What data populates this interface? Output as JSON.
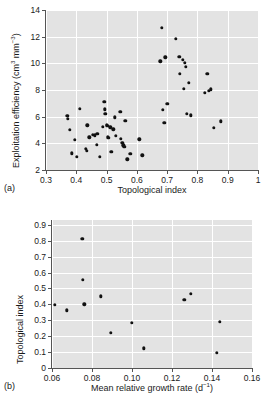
{
  "figure": {
    "background_color": "#ffffff",
    "plot_background_color": "#e3e3e3",
    "gridline_color": "#ffffff",
    "marker_color": "#111111",
    "axis_color": "#555555"
  },
  "panel_a": {
    "label": "(a)",
    "xlabel": "Topological index",
    "ylabel_html": "Exploitation efficiency (cm<sup>3</sup> mm<sup>−3</sup>)",
    "ylabel_plain": "Exploitation efficiency (cm3 mm-3)",
    "xticks": [
      "0.3",
      "0.4",
      "0.5",
      "0.6",
      "0.7",
      "0.8",
      "0.9",
      "1"
    ],
    "yticks": [
      "2",
      "4",
      "6",
      "8",
      "10",
      "12",
      "14"
    ]
  },
  "panel_b": {
    "label": "(b)",
    "xlabel_html": "Mean relative growth rate (d<sup>−1</sup>)",
    "xlabel_plain": "Mean relative growth rate (d-1)",
    "ylabel": "Topological index",
    "xticks": [
      "0.06",
      "0.08",
      "0.10",
      "0.12",
      "0.14",
      "0.16"
    ],
    "yticks": [
      "0",
      "0.1",
      "0.2",
      "0.3",
      "0.4",
      "0.5",
      "0.6",
      "0.7",
      "0.8",
      "0.9"
    ]
  },
  "chart_data": [
    {
      "type": "scatter",
      "panel": "a",
      "title": "",
      "xlabel": "Topological index",
      "ylabel": "Exploitation efficiency (cm3 mm-3)",
      "xlim": [
        0.3,
        1.0
      ],
      "ylim": [
        2,
        14
      ],
      "xticks": [
        0.3,
        0.4,
        0.5,
        0.6,
        0.7,
        0.8,
        0.9,
        1.0
      ],
      "yticks": [
        2,
        4,
        6,
        8,
        10,
        12,
        14
      ],
      "grid": true,
      "legend": "none",
      "points": [
        [
          0.37,
          6.05
        ],
        [
          0.372,
          5.85
        ],
        [
          0.378,
          5.0
        ],
        [
          0.385,
          3.25
        ],
        [
          0.395,
          4.25
        ],
        [
          0.402,
          3.0
        ],
        [
          0.412,
          6.6
        ],
        [
          0.432,
          3.6
        ],
        [
          0.435,
          3.45
        ],
        [
          0.437,
          5.35
        ],
        [
          0.443,
          4.45
        ],
        [
          0.455,
          4.65
        ],
        [
          0.462,
          4.6
        ],
        [
          0.468,
          3.9
        ],
        [
          0.47,
          4.7
        ],
        [
          0.478,
          3.0
        ],
        [
          0.487,
          5.25
        ],
        [
          0.492,
          7.1
        ],
        [
          0.494,
          6.55
        ],
        [
          0.496,
          6.2
        ],
        [
          0.5,
          5.4
        ],
        [
          0.502,
          5.3
        ],
        [
          0.505,
          4.45
        ],
        [
          0.508,
          4.4
        ],
        [
          0.512,
          5.2
        ],
        [
          0.515,
          3.35
        ],
        [
          0.522,
          5.05
        ],
        [
          0.528,
          5.95
        ],
        [
          0.53,
          4.55
        ],
        [
          0.545,
          6.35
        ],
        [
          0.548,
          4.35
        ],
        [
          0.552,
          4.05
        ],
        [
          0.555,
          3.85
        ],
        [
          0.558,
          3.75
        ],
        [
          0.562,
          5.7
        ],
        [
          0.568,
          2.8
        ],
        [
          0.578,
          3.2
        ],
        [
          0.608,
          4.3
        ],
        [
          0.618,
          3.1
        ],
        [
          0.678,
          10.15
        ],
        [
          0.682,
          12.65
        ],
        [
          0.685,
          6.5
        ],
        [
          0.69,
          5.55
        ],
        [
          0.694,
          10.45
        ],
        [
          0.7,
          6.95
        ],
        [
          0.728,
          11.85
        ],
        [
          0.74,
          10.5
        ],
        [
          0.742,
          9.2
        ],
        [
          0.752,
          10.25
        ],
        [
          0.756,
          8.1
        ],
        [
          0.758,
          10.05
        ],
        [
          0.762,
          9.75
        ],
        [
          0.765,
          6.2
        ],
        [
          0.772,
          8.55
        ],
        [
          0.778,
          6.1
        ],
        [
          0.825,
          7.8
        ],
        [
          0.832,
          9.2
        ],
        [
          0.838,
          7.95
        ],
        [
          0.845,
          8.05
        ],
        [
          0.855,
          5.15
        ],
        [
          0.878,
          5.65
        ]
      ]
    },
    {
      "type": "scatter",
      "panel": "b",
      "title": "",
      "xlabel": "Mean relative growth rate (d-1)",
      "ylabel": "Topological index",
      "xlim": [
        0.06,
        0.16
      ],
      "ylim": [
        0.0,
        0.93
      ],
      "xticks": [
        0.06,
        0.08,
        0.1,
        0.12,
        0.14,
        0.16
      ],
      "yticks": [
        0,
        0.1,
        0.2,
        0.3,
        0.4,
        0.5,
        0.6,
        0.7,
        0.8,
        0.9
      ],
      "grid": true,
      "legend": "none",
      "points": [
        [
          0.0615,
          0.398
        ],
        [
          0.0675,
          0.363
        ],
        [
          0.0752,
          0.812
        ],
        [
          0.0753,
          0.556
        ],
        [
          0.0762,
          0.4
        ],
        [
          0.0845,
          0.45
        ],
        [
          0.0893,
          0.222
        ],
        [
          0.0998,
          0.283
        ],
        [
          0.106,
          0.123
        ],
        [
          0.1262,
          0.428
        ],
        [
          0.1295,
          0.468
        ],
        [
          0.1425,
          0.097
        ],
        [
          0.144,
          0.292
        ]
      ]
    }
  ]
}
